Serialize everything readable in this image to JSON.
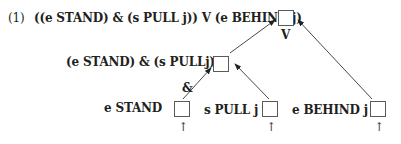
{
  "example": {
    "number": "(1)",
    "formula": "((e STAND) & (s PULL j)) V (e BEHIND j)"
  },
  "nodes": {
    "root": {
      "label": "",
      "operator": "V"
    },
    "conjunction": {
      "label": "(e STAND) & (s PULLj)",
      "operator": "&"
    },
    "leaves": [
      {
        "label": "e STAND",
        "input_arrow": "↑"
      },
      {
        "label": "s PULL j",
        "input_arrow": "↑"
      },
      {
        "label": "e BEHIND j",
        "input_arrow": "↑"
      }
    ]
  },
  "colors": {
    "text": "#231f20",
    "box_border": "#5a5a5a",
    "edge": "#333333"
  }
}
